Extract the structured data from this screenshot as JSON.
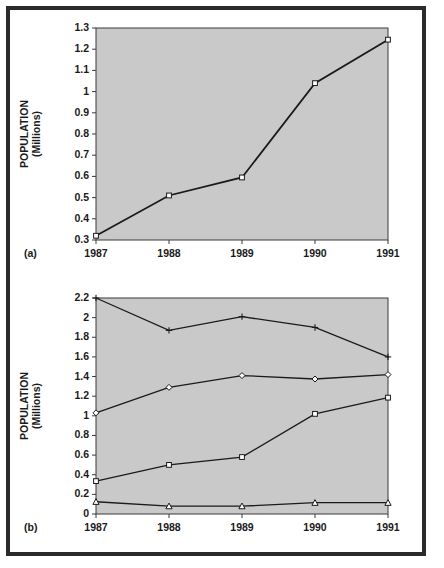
{
  "figure": {
    "background": "#ffffff",
    "frame_color": "#2b2b2b",
    "plot_background": "#c9c9c9",
    "line_color": "#1a1a1a",
    "width": 444,
    "height": 568
  },
  "panels": [
    {
      "tag": "(a)"
    },
    {
      "tag": "(b)"
    }
  ],
  "chart_data": [
    {
      "type": "line",
      "panel": "(a)",
      "title": "",
      "xlabel": "",
      "ylabel": "POPULATION (Millions)",
      "ylabel_line1": "POPULATION",
      "ylabel_line2": "(Millions)",
      "categories": [
        "1987",
        "1988",
        "1989",
        "1990",
        "1991"
      ],
      "x": [
        1987,
        1988,
        1989,
        1990,
        1991
      ],
      "xlim": [
        1987,
        1991
      ],
      "ylim": [
        0.3,
        1.3
      ],
      "yticks": [
        "0.3",
        "0.4",
        "0.5",
        "0.6",
        "0.7",
        "0.8",
        "0.9",
        "1",
        "1.1",
        "1.2",
        "1.3"
      ],
      "ytick_values": [
        0.3,
        0.4,
        0.5,
        0.6,
        0.7,
        0.8,
        0.9,
        1.0,
        1.1,
        1.2,
        1.3
      ],
      "grid": false,
      "legend": "none",
      "series": [
        {
          "name": "Total population",
          "marker": "square",
          "values": [
            0.32,
            0.51,
            0.595,
            1.04,
            1.245
          ]
        }
      ]
    },
    {
      "type": "line",
      "panel": "(b)",
      "title": "",
      "xlabel": "",
      "ylabel": "POPULATION (Millions)",
      "ylabel_line1": "POPULATION",
      "ylabel_line2": "(Millions)",
      "categories": [
        "1987",
        "1988",
        "1989",
        "1990",
        "1991"
      ],
      "x": [
        1987,
        1988,
        1989,
        1990,
        1991
      ],
      "xlim": [
        1987,
        1991
      ],
      "ylim": [
        0,
        2.2
      ],
      "yticks": [
        "0",
        "0.2",
        "0.4",
        "0.6",
        "0.8",
        "1",
        "1.2",
        "1.4",
        "1.6",
        "1.8",
        "2",
        "2.2"
      ],
      "ytick_values": [
        0,
        0.2,
        0.4,
        0.6,
        0.8,
        1.0,
        1.2,
        1.4,
        1.6,
        1.8,
        2.0,
        2.2
      ],
      "grid": false,
      "legend": "none",
      "series": [
        {
          "name": "Series 1",
          "marker": "plus",
          "values": [
            2.2,
            1.87,
            2.01,
            1.9,
            1.6
          ]
        },
        {
          "name": "Series 2",
          "marker": "diamond",
          "values": [
            1.03,
            1.29,
            1.41,
            1.375,
            1.42
          ]
        },
        {
          "name": "Series 3",
          "marker": "square",
          "values": [
            0.335,
            0.5,
            0.58,
            1.02,
            1.185
          ]
        },
        {
          "name": "Series 4",
          "marker": "triangle",
          "values": [
            0.125,
            0.08,
            0.08,
            0.115,
            0.115
          ]
        }
      ]
    }
  ]
}
